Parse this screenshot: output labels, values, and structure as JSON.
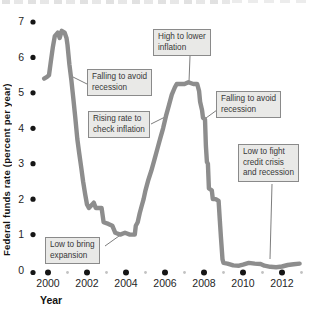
{
  "chart_data": {
    "type": "line",
    "title": "",
    "xlabel": "Year",
    "ylabel": "Federal funds rate (percent per year)",
    "x_axis": {
      "major_ticks": [
        2000,
        2002,
        2004,
        2006,
        2008,
        2010,
        2012
      ],
      "minor_ticks": [
        2001,
        2003,
        2005,
        2007,
        2009,
        2011,
        2013
      ],
      "range": [
        1999.5,
        2013.3
      ]
    },
    "y_axis": {
      "ticks": [
        0,
        1,
        2,
        3,
        4,
        5,
        6,
        7
      ],
      "range": [
        0,
        7
      ]
    },
    "series": [
      {
        "name": "Federal funds rate",
        "points": [
          [
            1999.8,
            5.4
          ],
          [
            1999.95,
            5.45
          ],
          [
            2000.05,
            5.5
          ],
          [
            2000.15,
            5.9
          ],
          [
            2000.25,
            6.3
          ],
          [
            2000.35,
            6.6
          ],
          [
            2000.5,
            6.7
          ],
          [
            2000.6,
            6.55
          ],
          [
            2000.7,
            6.75
          ],
          [
            2000.85,
            6.7
          ],
          [
            2000.95,
            6.55
          ],
          [
            2001.0,
            6.35
          ],
          [
            2001.1,
            5.8
          ],
          [
            2001.2,
            5.35
          ],
          [
            2001.3,
            4.85
          ],
          [
            2001.4,
            4.3
          ],
          [
            2001.5,
            3.7
          ],
          [
            2001.6,
            3.3
          ],
          [
            2001.7,
            2.9
          ],
          [
            2001.8,
            2.5
          ],
          [
            2001.9,
            2.15
          ],
          [
            2002.0,
            1.85
          ],
          [
            2002.1,
            1.75
          ],
          [
            2002.35,
            1.9
          ],
          [
            2002.45,
            1.75
          ],
          [
            2002.75,
            1.75
          ],
          [
            2002.85,
            1.35
          ],
          [
            2003.1,
            1.3
          ],
          [
            2003.3,
            1.25
          ],
          [
            2003.45,
            1.05
          ],
          [
            2003.7,
            1.0
          ],
          [
            2003.95,
            1.05
          ],
          [
            2004.2,
            1.0
          ],
          [
            2004.45,
            1.0
          ],
          [
            2004.5,
            1.25
          ],
          [
            2004.6,
            1.35
          ],
          [
            2004.7,
            1.6
          ],
          [
            2004.8,
            1.8
          ],
          [
            2004.9,
            2.0
          ],
          [
            2005.0,
            2.25
          ],
          [
            2005.15,
            2.55
          ],
          [
            2005.3,
            2.8
          ],
          [
            2005.45,
            3.1
          ],
          [
            2005.6,
            3.4
          ],
          [
            2005.75,
            3.7
          ],
          [
            2005.9,
            4.0
          ],
          [
            2006.05,
            4.35
          ],
          [
            2006.2,
            4.65
          ],
          [
            2006.35,
            4.95
          ],
          [
            2006.5,
            5.15
          ],
          [
            2006.6,
            5.25
          ],
          [
            2007.0,
            5.25
          ],
          [
            2007.2,
            5.3
          ],
          [
            2007.45,
            5.25
          ],
          [
            2007.65,
            5.25
          ],
          [
            2007.75,
            5.05
          ],
          [
            2007.8,
            4.75
          ],
          [
            2007.9,
            4.5
          ],
          [
            2007.95,
            4.3
          ],
          [
            2008.05,
            4.25
          ],
          [
            2008.1,
            3.5
          ],
          [
            2008.15,
            3.05
          ],
          [
            2008.2,
            3.0
          ],
          [
            2008.25,
            2.3
          ],
          [
            2008.4,
            2.25
          ],
          [
            2008.45,
            2.0
          ],
          [
            2008.6,
            2.0
          ],
          [
            2008.75,
            1.95
          ],
          [
            2008.8,
            1.5
          ],
          [
            2008.87,
            0.9
          ],
          [
            2008.95,
            0.3
          ],
          [
            2009.0,
            0.2
          ],
          [
            2009.2,
            0.18
          ],
          [
            2009.5,
            0.13
          ],
          [
            2009.8,
            0.12
          ],
          [
            2010.0,
            0.15
          ],
          [
            2010.3,
            0.2
          ],
          [
            2010.6,
            0.18
          ],
          [
            2010.9,
            0.17
          ],
          [
            2011.1,
            0.12
          ],
          [
            2011.4,
            0.09
          ],
          [
            2011.7,
            0.08
          ],
          [
            2012.0,
            0.1
          ],
          [
            2012.3,
            0.14
          ],
          [
            2012.6,
            0.16
          ],
          [
            2012.9,
            0.18
          ]
        ]
      }
    ],
    "annotations": [
      {
        "text": "High to lower\ninflation",
        "pointer": [
          [
            190,
            56
          ],
          [
            189,
            82
          ]
        ]
      },
      {
        "text": "Falling to avoid\nrecession",
        "pointer": [
          [
            87,
            84
          ],
          [
            69,
            75
          ]
        ]
      },
      {
        "text": "Rising rate to\ncheck inflation",
        "pointer": [
          [
            151,
            124
          ],
          [
            165,
            117
          ]
        ]
      },
      {
        "text": "Falling to avoid\nrecession",
        "pointer": [
          [
            217,
            110
          ],
          [
            206,
            118
          ]
        ]
      },
      {
        "text": "Low to fight\ncredit crisis\nand recession",
        "pointer": [
          [
            272,
            184
          ],
          [
            270,
            259
          ]
        ]
      },
      {
        "text": "Low to bring\nexpansion",
        "pointer": [
          [
            105,
            246
          ],
          [
            119,
            236
          ]
        ]
      }
    ],
    "colors": {
      "line": "#8d8d8d",
      "major_dot": "#161616",
      "minor_dot": "#c2c2c2",
      "pointer_line": "#6e6e6e",
      "callout_bg": "#e9e9e7",
      "callout_border": "#8a8a8a"
    },
    "legend": "none",
    "grid": "off"
  }
}
